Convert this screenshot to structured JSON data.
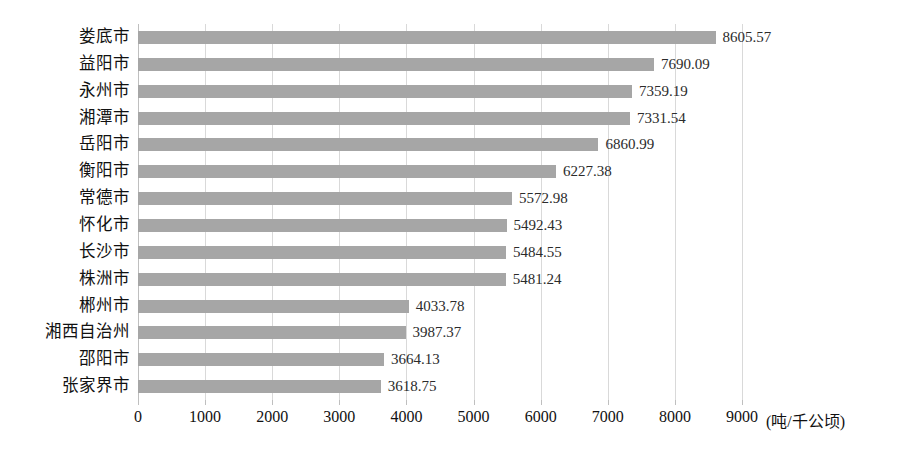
{
  "chart_data": {
    "type": "bar",
    "orientation": "horizontal",
    "title": "",
    "xlabel": "(吨/千公顷)",
    "ylabel": "",
    "xlim": [
      0,
      9000
    ],
    "xticks": [
      0,
      1000,
      2000,
      3000,
      4000,
      5000,
      6000,
      7000,
      8000,
      9000
    ],
    "xtick_labels": [
      "0",
      "1000",
      "2000",
      "3000",
      "4000",
      "5000",
      "6000",
      "7000",
      "8000",
      "9000"
    ],
    "grid": true,
    "legend": null,
    "bar_color": "#a6a6a6",
    "gridline_color": "#d9d9d9",
    "categories": [
      "娄底市",
      "益阳市",
      "永州市",
      "湘潭市",
      "岳阳市",
      "衡阳市",
      "常德市",
      "怀化市",
      "长沙市",
      "株洲市",
      "郴州市",
      "湘西自治州",
      "邵阳市",
      "张家界市"
    ],
    "values": [
      8605.57,
      7690.09,
      7359.19,
      7331.54,
      6860.99,
      6227.38,
      5572.98,
      5492.43,
      5484.55,
      5481.24,
      4033.78,
      3987.37,
      3664.13,
      3618.75
    ],
    "value_labels": [
      "8605.57",
      "7690.09",
      "7359.19",
      "7331.54",
      "6860.99",
      "6227.38",
      "5572.98",
      "5492.43",
      "5484.55",
      "5481.24",
      "4033.78",
      "3987.37",
      "3664.13",
      "3618.75"
    ]
  }
}
